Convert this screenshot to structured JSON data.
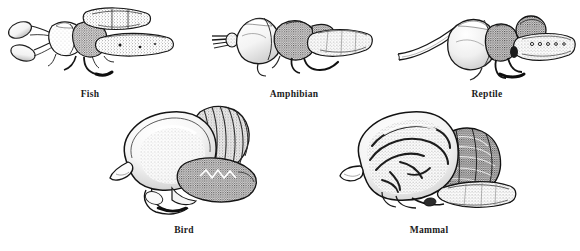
{
  "figure": {
    "style": "stippled pen-and-ink scientific illustration",
    "background_color": "#ffffff",
    "ink_color": "#1b1b1b",
    "stipple_color": "#5a5a5a",
    "width": 580,
    "height": 251
  },
  "panels": [
    {
      "id": "fish",
      "label": "Fish",
      "icon": "fish-brain-illustration",
      "row": "top",
      "order": 1,
      "description": "Lateral view of a fish brain showing paired olfactory bulbs on long stalks, small cerebrum, large optic lobes, cerebellum and elongated medulla extending into spinal cord"
    },
    {
      "id": "amphibian",
      "label": "Amphibian",
      "icon": "amphibian-brain-illustration",
      "row": "top",
      "order": 2,
      "description": "Lateral view of an amphibian brain showing short olfactory bulbs, elongated cerebral hemispheres, rounded optic lobe, small cerebellum and tapering medulla"
    },
    {
      "id": "reptile",
      "label": "Reptile",
      "icon": "reptile-brain-illustration",
      "row": "top",
      "order": 3,
      "description": "Lateral view of a reptile brain showing long olfactory tracts, enlarged pear-shaped cerebrum, optic lobe, small cerebellum and medulla"
    },
    {
      "id": "bird",
      "label": "Bird",
      "icon": "bird-brain-illustration",
      "row": "bottom",
      "order": 4,
      "description": "Lateral view of a bird brain showing a greatly enlarged smooth cerebrum, small olfactory bulb, prominent folded cerebellum and medulla"
    },
    {
      "id": "mammal",
      "label": "Mammal",
      "icon": "mammal-brain-illustration",
      "row": "bottom",
      "order": 5,
      "description": "Lateral view of a mammal brain showing a large convoluted cerebrum with gyri and sulci, olfactory bulb, densely foliated cerebellum and brain stem"
    }
  ]
}
